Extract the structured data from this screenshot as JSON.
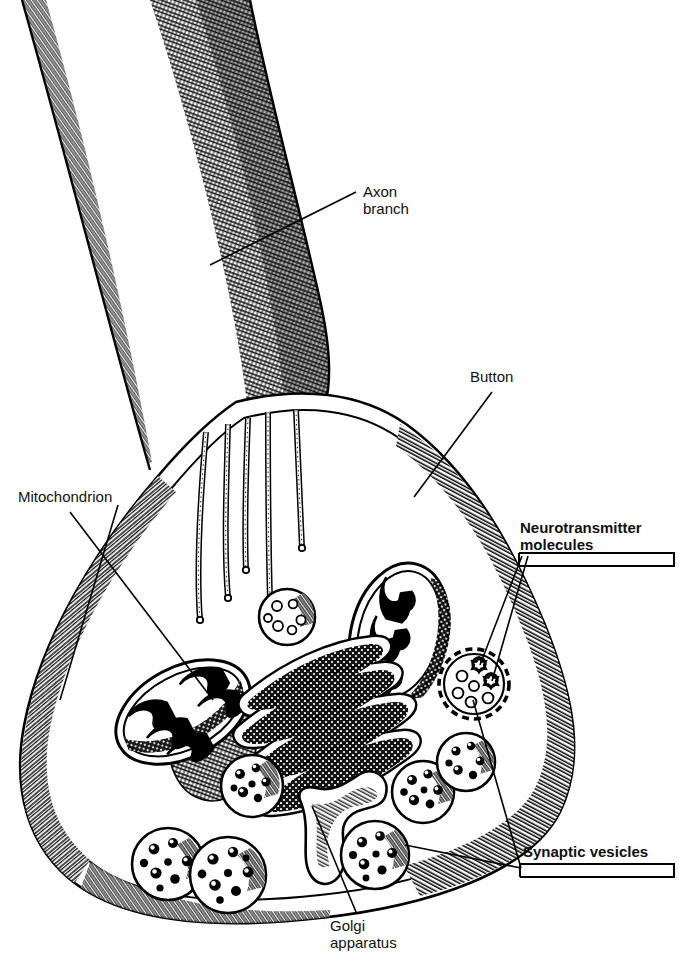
{
  "figure": {
    "style": "pen-and-ink line drawing, black on white",
    "width": 679,
    "height": 969,
    "ink_color": "#000000",
    "background_color": "#ffffff"
  },
  "labels": {
    "axon_branch": "Axon\nbranch",
    "button": "Button",
    "mitochondrion": "Mitochondrion",
    "neurotransmitter_molecules": "Neurotransmitter\nmolecules",
    "golgi_apparatus": "Golgi\napparatus",
    "synaptic_vesicles": "Synaptic vesicles"
  },
  "label_styles": {
    "axon_branch": "regular",
    "button": "regular",
    "mitochondrion": "regular",
    "neurotransmitter_molecules": "bold",
    "golgi_apparatus": "regular",
    "synaptic_vesicles": "bold"
  },
  "structures": [
    {
      "name": "axon-branch",
      "count": 1,
      "note": "stippled tubular process entering from top"
    },
    {
      "name": "button-membrane",
      "count": 1,
      "note": "double-outline terminal bouton with hatched rim"
    },
    {
      "name": "microtubule",
      "count": 5,
      "note": "hatched filaments descending from axon into button"
    },
    {
      "name": "mitochondrion",
      "count": 2,
      "note": "cristae-filled organelles, left and right of Golgi"
    },
    {
      "name": "golgi-apparatus",
      "count": 1,
      "note": "stacked cisternae with budding vesicles"
    },
    {
      "name": "synaptic-vesicle",
      "count": 9,
      "note": "round granule-filled vesicles"
    },
    {
      "name": "docked-vesicle",
      "count": 1,
      "note": "dashed-outline vesicle with neurotransmitter molecules"
    },
    {
      "name": "neurotransmitter-molecule",
      "count": 2,
      "note": "small clustered molecules called out by leader lines"
    }
  ]
}
